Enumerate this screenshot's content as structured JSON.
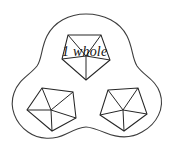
{
  "figure": {
    "name": "one-whole-partitioned-into-three-pentagon-pieces",
    "label": "1 whole",
    "colors": {
      "background": "#ffffff",
      "blob_stroke": "#3d3d3d",
      "piece_stroke": "#262626",
      "label_text": "#0f0f0f"
    },
    "outer_region": {
      "name": "whole-region",
      "lobes": 3,
      "path": "M 86 14 C 104 14 120 22 127 36 C 133 48 132 58 137 66 C 144 76 156 80 160 93 C 165 108 157 124 142 132 C 130 139 116 137 106 133 C 96 129 90 127 86 127 C 81 127 74 130 66 134 C 54 140 39 140 28 132 C 15 123 9 107 14 93 C 18 80 30 75 37 66 C 42 59 41 48 47 36 C 54 22 69 14 86 14 Z"
    },
    "pieces": [
      {
        "name": "piece-top",
        "sides": 5,
        "sectors": 5,
        "center": [
          86,
          56
        ],
        "vertices": [
          [
            68,
            35
          ],
          [
            101,
            35
          ],
          [
            110,
            60
          ],
          [
            86,
            80
          ],
          [
            62,
            59
          ]
        ]
      },
      {
        "name": "piece-lower-left",
        "sides": 5,
        "sectors": 5,
        "center": [
          51,
          110
        ],
        "vertices": [
          [
            42,
            88
          ],
          [
            73,
            92
          ],
          [
            76,
            118
          ],
          [
            52,
            131
          ],
          [
            27,
            110
          ]
        ]
      },
      {
        "name": "piece-lower-right",
        "sides": 5,
        "sectors": 5,
        "center": [
          123,
          110
        ],
        "vertices": [
          [
            108,
            90
          ],
          [
            138,
            88
          ],
          [
            147,
            114
          ],
          [
            124,
            131
          ],
          [
            100,
            115
          ]
        ]
      }
    ]
  }
}
